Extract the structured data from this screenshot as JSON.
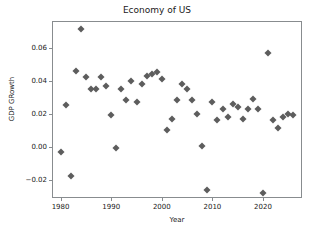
{
  "chart_data": {
    "type": "scatter",
    "title": "Economy of US",
    "xlabel": "Year",
    "ylabel": "GDP GRowth",
    "xlim": [
      1978.5,
      2027.5
    ],
    "ylim": [
      -0.0305,
      0.0755
    ],
    "grid": false,
    "legend": null,
    "marker": "diamond",
    "marker_color": "#5d5d5d",
    "xticks": [
      1980,
      1990,
      2000,
      2010,
      2020
    ],
    "xticklabels": [
      "1980",
      "1990",
      "2000",
      "2010",
      "2020"
    ],
    "yticks": [
      -0.02,
      0.0,
      0.02,
      0.04,
      0.06
    ],
    "yticklabels": [
      "−0.02",
      "0.00",
      "0.02",
      "0.04",
      "0.06"
    ],
    "x": [
      1980,
      1981,
      1982,
      1983,
      1984,
      1985,
      1986,
      1987,
      1988,
      1989,
      1990,
      1991,
      1992,
      1993,
      1994,
      1995,
      1996,
      1997,
      1998,
      1999,
      2000,
      2001,
      2002,
      2003,
      2004,
      2005,
      2006,
      2007,
      2008,
      2009,
      2010,
      2011,
      2012,
      2013,
      2014,
      2015,
      2016,
      2017,
      2018,
      2019,
      2020,
      2021,
      2022,
      2023,
      2024,
      2025,
      2026
    ],
    "y": [
      -0.003,
      0.025,
      -0.018,
      0.046,
      0.071,
      0.042,
      0.035,
      0.035,
      0.042,
      0.037,
      0.019,
      -0.001,
      0.035,
      0.028,
      0.04,
      0.027,
      0.038,
      0.043,
      0.044,
      0.045,
      0.041,
      0.01,
      0.017,
      0.028,
      0.038,
      0.035,
      0.028,
      0.02,
      0.0005,
      -0.026,
      0.027,
      0.016,
      0.023,
      0.018,
      0.026,
      0.024,
      0.017,
      0.023,
      0.029,
      0.023,
      -0.028,
      0.057,
      0.016,
      0.011,
      0.018,
      0.02,
      0.019
    ],
    "points": [
      {
        "year": 1980,
        "growth": -0.003
      },
      {
        "year": 1981,
        "growth": 0.025
      },
      {
        "year": 1982,
        "growth": -0.018
      },
      {
        "year": 1983,
        "growth": 0.046
      },
      {
        "year": 1984,
        "growth": 0.071
      },
      {
        "year": 1985,
        "growth": 0.042
      },
      {
        "year": 1986,
        "growth": 0.035
      },
      {
        "year": 1987,
        "growth": 0.035
      },
      {
        "year": 1988,
        "growth": 0.042
      },
      {
        "year": 1989,
        "growth": 0.037
      },
      {
        "year": 1990,
        "growth": 0.019
      },
      {
        "year": 1991,
        "growth": -0.001
      },
      {
        "year": 1992,
        "growth": 0.035
      },
      {
        "year": 1993,
        "growth": 0.028
      },
      {
        "year": 1994,
        "growth": 0.04
      },
      {
        "year": 1995,
        "growth": 0.027
      },
      {
        "year": 1996,
        "growth": 0.038
      },
      {
        "year": 1997,
        "growth": 0.043
      },
      {
        "year": 1998,
        "growth": 0.044
      },
      {
        "year": 1999,
        "growth": 0.045
      },
      {
        "year": 2000,
        "growth": 0.041
      },
      {
        "year": 2001,
        "growth": 0.01
      },
      {
        "year": 2002,
        "growth": 0.017
      },
      {
        "year": 2003,
        "growth": 0.028
      },
      {
        "year": 2004,
        "growth": 0.038
      },
      {
        "year": 2005,
        "growth": 0.035
      },
      {
        "year": 2006,
        "growth": 0.028
      },
      {
        "year": 2007,
        "growth": 0.02
      },
      {
        "year": 2008,
        "growth": 0.0005
      },
      {
        "year": 2009,
        "growth": -0.026
      },
      {
        "year": 2010,
        "growth": 0.027
      },
      {
        "year": 2011,
        "growth": 0.016
      },
      {
        "year": 2012,
        "growth": 0.023
      },
      {
        "year": 2013,
        "growth": 0.018
      },
      {
        "year": 2014,
        "growth": 0.026
      },
      {
        "year": 2015,
        "growth": 0.024
      },
      {
        "year": 2016,
        "growth": 0.017
      },
      {
        "year": 2017,
        "growth": 0.023
      },
      {
        "year": 2018,
        "growth": 0.029
      },
      {
        "year": 2019,
        "growth": 0.023
      },
      {
        "year": 2020,
        "growth": -0.028
      },
      {
        "year": 2021,
        "growth": 0.057
      },
      {
        "year": 2022,
        "growth": 0.016
      },
      {
        "year": 2023,
        "growth": 0.011
      },
      {
        "year": 2024,
        "growth": 0.018
      },
      {
        "year": 2025,
        "growth": 0.02
      },
      {
        "year": 2026,
        "growth": 0.019
      }
    ]
  }
}
